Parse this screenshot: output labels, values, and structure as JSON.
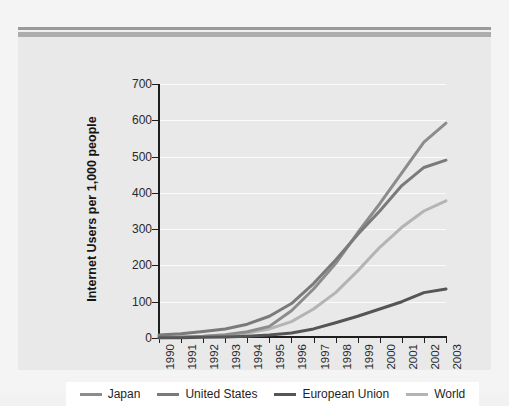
{
  "figure": {
    "background": "#e9e9e9",
    "plot_background": "#e9e9e9",
    "gridline_color": "#fbfbfb",
    "axis_color": "#1e1e1e"
  },
  "chart_data": {
    "type": "line",
    "title": "",
    "xlabel": "",
    "ylabel": "Internet Users per 1,000 people",
    "x": [
      "1990",
      "1991",
      "1992",
      "1993",
      "1994",
      "1995",
      "1996",
      "1997",
      "1998",
      "1999",
      "2000",
      "2001",
      "2002",
      "2003"
    ],
    "categories": [
      "1990",
      "1991",
      "1992",
      "1993",
      "1994",
      "1995",
      "1996",
      "1997",
      "1998",
      "1999",
      "2000",
      "2001",
      "2002",
      "2003"
    ],
    "xlim": [
      1990,
      2003
    ],
    "ylim": [
      0,
      700
    ],
    "yticks": [
      0,
      100,
      200,
      300,
      400,
      500,
      600,
      700
    ],
    "ytick_labels": [
      "0",
      "100",
      "200",
      "300",
      "400",
      "500",
      "600",
      "700"
    ],
    "grid": true,
    "legend_position": "bottom",
    "series": [
      {
        "name": "Japan",
        "color": "#8c8c8c",
        "values": [
          2,
          3,
          5,
          9,
          17,
          32,
          75,
          135,
          205,
          290,
          370,
          455,
          540,
          592
        ]
      },
      {
        "name": "United States",
        "color": "#7a7a7a",
        "values": [
          8,
          12,
          18,
          25,
          38,
          60,
          95,
          150,
          215,
          285,
          350,
          420,
          470,
          490
        ]
      },
      {
        "name": "European Union",
        "color": "#555555",
        "values": [
          1,
          1,
          2,
          3,
          5,
          8,
          14,
          25,
          42,
          60,
          80,
          100,
          125,
          135
        ]
      },
      {
        "name": "World",
        "color": "#b4b4b4",
        "values": [
          1,
          2,
          4,
          7,
          14,
          25,
          45,
          80,
          125,
          185,
          250,
          305,
          350,
          378
        ]
      }
    ]
  },
  "legend": {
    "items": [
      {
        "label": "Japan",
        "color": "#8c8c8c"
      },
      {
        "label": "United States",
        "color": "#7a7a7a"
      },
      {
        "label": "European Union",
        "color": "#555555"
      },
      {
        "label": "World",
        "color": "#b4b4b4"
      }
    ]
  }
}
